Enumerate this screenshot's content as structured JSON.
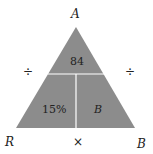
{
  "diagram": {
    "type": "formula-triangle",
    "fill_color": "#8c8c8c",
    "divider_color": "#ffffff",
    "vertices": {
      "top": "A",
      "bottom_left": "R",
      "bottom_right": "B"
    },
    "cells": {
      "top": "84",
      "bottom_left": "15%",
      "bottom_right": "B"
    },
    "operators": {
      "left": "÷",
      "right": "÷",
      "bottom": "×"
    }
  }
}
